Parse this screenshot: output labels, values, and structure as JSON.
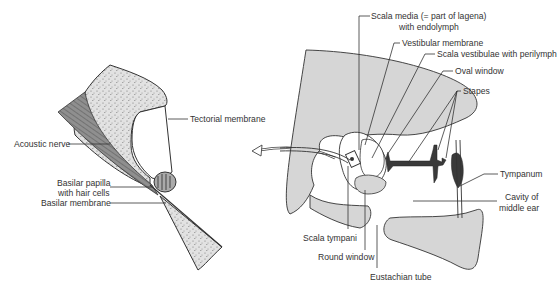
{
  "diagram": {
    "left_panel": {
      "labels": {
        "tectorial_membrane": "Tectorial membrane",
        "acoustic_nerve": "Acoustic nerve",
        "basilar_papilla_1": "Basilar papilla",
        "basilar_papilla_2": "with hair cells",
        "basilar_membrane": "Basilar membrane"
      }
    },
    "right_panel": {
      "labels": {
        "scala_media_1": "Scala media (= part of lagena)",
        "scala_media_2": "with endolymph",
        "vestibular_membrane": "Vestibular membrane",
        "scala_vestibulae": "Scala vestibulae with perilymph",
        "oval_window": "Oval window",
        "stapes": "Stapes",
        "tympanum": "Tympanum",
        "cavity_1": "Cavity of",
        "cavity_2": "middle ear",
        "scala_tympani": "Scala tympani",
        "round_window": "Round window",
        "eustachian_tube": "Eustachian tube"
      }
    },
    "colors": {
      "bone_fill": "#d6d6d6",
      "stroke": "#333333",
      "stapes_fill": "#3a3a3a",
      "nerve_fill": "#8a8a8a"
    }
  }
}
